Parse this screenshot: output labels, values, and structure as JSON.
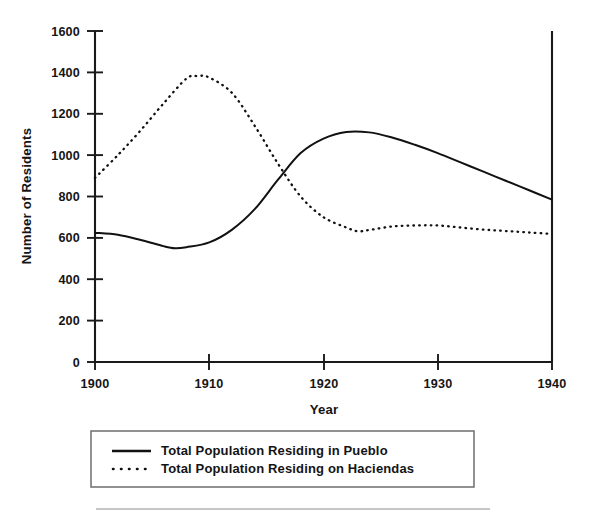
{
  "chart_data": {
    "type": "line",
    "title": "",
    "xlabel": "Year",
    "ylabel": "Number of Residents",
    "xlim": [
      1900,
      1940
    ],
    "ylim": [
      0,
      1600
    ],
    "grid": false,
    "legend_position": "below-plot",
    "x_ticks": [
      "1900",
      "1910",
      "1920",
      "1930",
      "1940"
    ],
    "x_tick_values": [
      1900,
      1910,
      1920,
      1930,
      1940
    ],
    "y_ticks": [
      "0",
      "200",
      "400",
      "600",
      "800",
      "1000",
      "1200",
      "1400",
      "1600"
    ],
    "y_tick_values": [
      0,
      200,
      400,
      600,
      800,
      1000,
      1200,
      1400,
      1600
    ],
    "series": [
      {
        "name": "Total Population Residing in Pueblo",
        "style": "solid",
        "color": "#111111",
        "x": [
          1900,
          1902,
          1904,
          1906,
          1907,
          1908,
          1910,
          1912,
          1914,
          1916,
          1918,
          1920,
          1922,
          1924,
          1926,
          1928,
          1930,
          1932,
          1934,
          1936,
          1938,
          1940
        ],
        "values": [
          625,
          615,
          590,
          560,
          550,
          555,
          578,
          640,
          740,
          880,
          1010,
          1080,
          1112,
          1110,
          1085,
          1050,
          1010,
          965,
          920,
          875,
          830,
          785
        ]
      },
      {
        "name": "Total Population Residing on Haciendas",
        "style": "dotted",
        "color": "#111111",
        "x": [
          1900,
          1902,
          1904,
          1906,
          1908,
          1909,
          1910,
          1912,
          1914,
          1916,
          1918,
          1920,
          1922,
          1923,
          1924,
          1926,
          1928,
          1930,
          1932,
          1934,
          1936,
          1938,
          1940
        ],
        "values": [
          890,
          1000,
          1120,
          1250,
          1370,
          1382,
          1375,
          1300,
          1140,
          960,
          800,
          700,
          650,
          632,
          638,
          655,
          660,
          660,
          650,
          640,
          633,
          626,
          619
        ]
      }
    ],
    "annotations": []
  },
  "legend": {
    "entries": [
      {
        "label": "Total Population Residing in Pueblo",
        "style": "solid"
      },
      {
        "label": "Total Population Residing on Haciendas",
        "style": "dotted"
      }
    ]
  }
}
